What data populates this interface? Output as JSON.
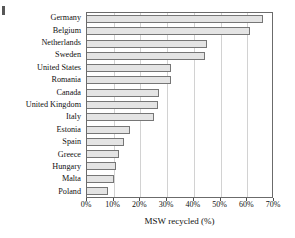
{
  "chart_data": {
    "type": "bar",
    "orientation": "horizontal",
    "title": "",
    "xlabel": "MSW recycled (%)",
    "ylabel": "",
    "xlim": [
      0,
      70
    ],
    "xtick_values": [
      0,
      10,
      20,
      30,
      40,
      50,
      60,
      70
    ],
    "xtick_labels": [
      "0%",
      "10%",
      "20%",
      "30%",
      "40%",
      "50%",
      "60%",
      "70%"
    ],
    "grid": "vertical",
    "legend": "none",
    "categories": [
      "Germany",
      "Belgium",
      "Netherlands",
      "Sweden",
      "United States",
      "Romania",
      "Canada",
      "United Kingdom",
      "Italy",
      "Estonia",
      "Spain",
      "Greece",
      "Hungary",
      "Malta",
      "Poland"
    ],
    "values": [
      66,
      61,
      45,
      44,
      31.5,
      31.5,
      27,
      26.5,
      25,
      16,
      14,
      12,
      11,
      10,
      8
    ],
    "bar_fill_color": "#e4e4e4",
    "bar_border_color": "#767676",
    "gridline_color": "#d2d2d2",
    "axis_color": "#6b6b6b"
  }
}
